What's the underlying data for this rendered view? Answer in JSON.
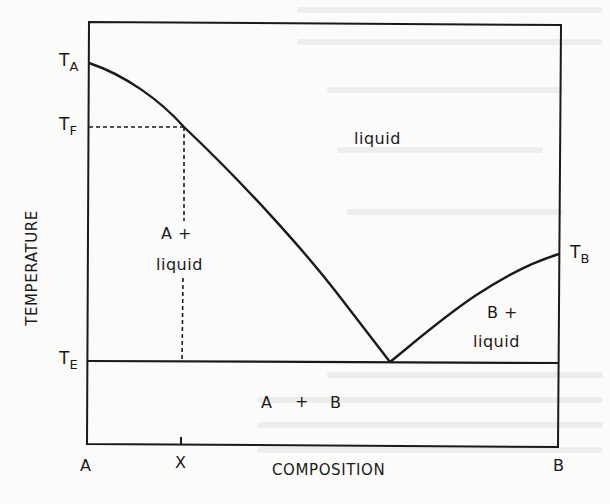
{
  "diagram": {
    "type": "phase-diagram",
    "axes": {
      "x_label": "COMPOSITION",
      "y_label": "TEMPERATURE",
      "x_ticks": [
        {
          "label": "A",
          "position": "left-end"
        },
        {
          "label": "X",
          "position": "marked-composition"
        },
        {
          "label": "B",
          "position": "right-end"
        }
      ]
    },
    "temperature_labels": {
      "TA": {
        "main": "T",
        "sub": "A"
      },
      "TF": {
        "main": "T",
        "sub": "F"
      },
      "TE": {
        "main": "T",
        "sub": "E"
      },
      "TB": {
        "main": "T",
        "sub": "B"
      }
    },
    "regions": {
      "liquid": "liquid",
      "a_plus_liquid": {
        "line1": "A +",
        "line2": "liquid"
      },
      "b_plus_liquid": {
        "line1": "B +",
        "line2": "liquid"
      },
      "a_plus_b": {
        "a": "A",
        "plus": "+",
        "b": "B"
      }
    },
    "lines": [
      {
        "name": "liquidus-A",
        "from": "TA",
        "to": "eutectic-point",
        "style": "solid-curve"
      },
      {
        "name": "liquidus-B",
        "from": "TB",
        "to": "eutectic-point",
        "style": "solid-curve"
      },
      {
        "name": "eutectic-isotherm",
        "at": "TE",
        "style": "solid-horizontal"
      },
      {
        "name": "composition-X-drop",
        "at": "X",
        "from": "TF",
        "to": "TE",
        "style": "dashed-vertical"
      },
      {
        "name": "TF-guide",
        "at": "TF",
        "from": "A-axis",
        "to": "liquidus-A",
        "style": "dashed-horizontal"
      }
    ],
    "colors": {
      "ink": "#1a1a1a",
      "paper": "#fbfbfa"
    }
  }
}
